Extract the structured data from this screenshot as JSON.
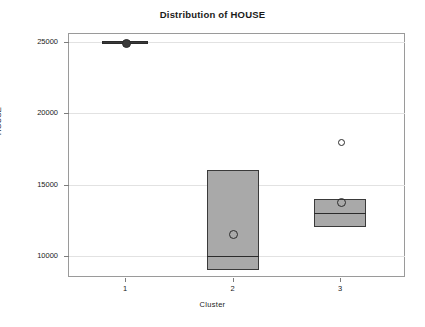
{
  "chart_data": {
    "type": "box",
    "title": "Distribution of HOUSE",
    "xlabel": "Cluster",
    "ylabel": "HOUSE",
    "categories": [
      "1",
      "2",
      "3"
    ],
    "ylim": [
      8300,
      26000
    ],
    "yticks": [
      10000,
      15000,
      20000,
      25000
    ],
    "ytick_labels": [
      "10000",
      "15000",
      "20000",
      "25000"
    ],
    "grid": true,
    "legend": "none",
    "boxes": [
      {
        "category": "1",
        "q1": 25000,
        "median": 25000,
        "q3": 25000,
        "whisker_low": 25000,
        "whisker_high": 25000,
        "mean": 25000,
        "degenerate": true,
        "outliers": []
      },
      {
        "category": "2",
        "q1": 9000,
        "median": 10000,
        "q3": 16000,
        "whisker_low": 9000,
        "whisker_high": 16000,
        "mean": 11600,
        "degenerate": false,
        "outliers": []
      },
      {
        "category": "3",
        "q1": 12000,
        "median": 13000,
        "q3": 14000,
        "whisker_low": 12000,
        "whisker_high": 14000,
        "mean": 13800,
        "degenerate": false,
        "outliers": [
          18000
        ]
      }
    ],
    "colors": {
      "box_fill": "#a9a9a9",
      "box_edge": "#3a3a3a",
      "grid": "#e2e2e2",
      "frame": "#9a9a9a",
      "text": "#1a1a1a",
      "background": "#ffffff"
    }
  }
}
